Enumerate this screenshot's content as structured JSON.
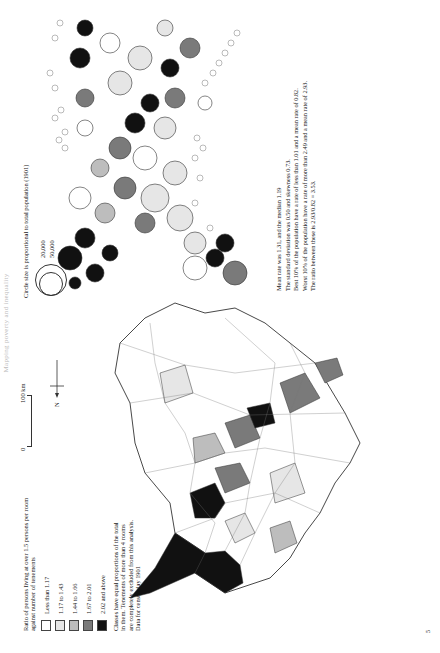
{
  "running_head": "Mapping poverty and inequality",
  "choropleth": {
    "legend": {
      "title": "Ratio of persons living at over 1.5 persons per room against number of tenements",
      "classes": [
        {
          "label": "Less than 1.17",
          "color": "#ffffff"
        },
        {
          "label": "1.17 to 1.43",
          "color": "#e6e6e6"
        },
        {
          "label": "1.44 to 1.66",
          "color": "#bdbdbd"
        },
        {
          "label": "1.67 to 2.01",
          "color": "#7a7a7a"
        },
        {
          "label": "2.02 and above",
          "color": "#111111"
        }
      ],
      "note": "Classes have equal proportions of the total in them. Tenements of more than 4 rooms are completely excluded from this analysis. Data for census day 1901"
    },
    "scale_bar": {
      "start_label": "0",
      "end_label": "100 km"
    },
    "north_arrow": {
      "label": "N"
    }
  },
  "cartogram": {
    "legend": {
      "title": "Circle size is proportional to total population (1901)",
      "sizes": [
        "20,000",
        "50,000"
      ]
    }
  },
  "stats": {
    "lines": [
      "Mean rate was 1.31, and the median 1.19",
      "The standard deviation was 0.50 and skewness 0.73.",
      "Best 10% of the population have a rate of less than 1.01 and a mean rate of 0.82.",
      "Worst 10% of the population have a rate of more than 2.49 and a mean rate of 2.93.",
      "The ratio between these is 2.93/0.82 = 3.53."
    ]
  },
  "folio": "5"
}
